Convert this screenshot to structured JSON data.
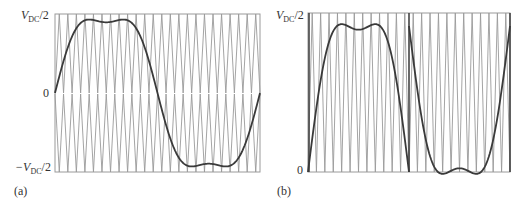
{
  "figure": {
    "panels": [
      {
        "id": "a",
        "caption": "(a)",
        "y_labels": {
          "top": "V",
          "top_sub": "DC",
          "top_suffix": "/2",
          "mid": "0",
          "bottom_prefix": "−V",
          "bottom_sub": "DC",
          "bottom_suffix": "/2"
        }
      },
      {
        "id": "b",
        "caption": "(b)",
        "y_labels": {
          "top": "V",
          "top_sub": "DC",
          "top_suffix": "/2",
          "bottom": "0"
        }
      }
    ],
    "colors": {
      "carrier": "#9a9a9a",
      "modulating": "#3a3a3a",
      "background": "#ffffff"
    }
  },
  "chart_data": [
    {
      "type": "line",
      "panel": "(a)",
      "title": "",
      "xlabel": "",
      "ylabel": "",
      "ytick_labels": [
        "V_DC/2",
        "0",
        "-V_DC/2"
      ],
      "ylim": [
        -1,
        1
      ],
      "grid": false,
      "series": [
        {
          "name": "modulating (sine + third harmonic)",
          "description": "one fundamental period, flat-topped with double hump; peak ~0.93 of V_DC/2, center dip ~0.8",
          "x": [
            0,
            0.05,
            0.1,
            0.15,
            0.2,
            0.25,
            0.3,
            0.35,
            0.4,
            0.45,
            0.5,
            0.55,
            0.6,
            0.65,
            0.7,
            0.75,
            0.8,
            0.85,
            0.9,
            0.95,
            1.0
          ],
          "y": [
            0,
            0.4,
            0.78,
            0.9,
            0.93,
            0.8,
            0.93,
            0.9,
            0.78,
            0.4,
            0,
            -0.4,
            -0.78,
            -0.9,
            -0.93,
            -0.8,
            -0.93,
            -0.9,
            -0.78,
            -0.4,
            0
          ]
        },
        {
          "name": "carriers (level-shifted triangles)",
          "description": "two stacked triangle carriers, upper 0..V_DC/2 and lower -V_DC/2..0, ~24 cycles per period"
        }
      ]
    },
    {
      "type": "line",
      "panel": "(b)",
      "title": "",
      "xlabel": "",
      "ylabel": "",
      "ytick_labels": [
        "V_DC/2",
        "0"
      ],
      "ylim": [
        0,
        1
      ],
      "grid": false,
      "series": [
        {
          "name": "modulating (rectified/folded)",
          "description": "positive half-cycle then inverted negative half-cycle, separated by a vertical divider at mid-period",
          "x": [
            0,
            0.05,
            0.1,
            0.15,
            0.2,
            0.25,
            0.3,
            0.35,
            0.4,
            0.45,
            0.5,
            0.55,
            0.6,
            0.65,
            0.7,
            0.75,
            0.8,
            0.85,
            0.9,
            0.95,
            1.0
          ],
          "y": [
            0,
            0.45,
            0.82,
            0.92,
            0.93,
            0.83,
            0.93,
            0.92,
            0.82,
            0.45,
            1.0,
            0.55,
            0.18,
            0.08,
            0.07,
            0.17,
            0.07,
            0.08,
            0.18,
            0.55,
            1.0
          ]
        },
        {
          "name": "carrier (triangle 0..V_DC/2)",
          "description": "~24 narrow triangle cycles per period"
        }
      ]
    }
  ]
}
